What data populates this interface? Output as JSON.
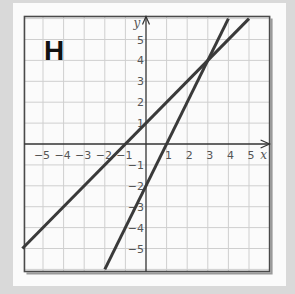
{
  "panel": {
    "letter": "H"
  },
  "chart_data": {
    "type": "line",
    "title": "H",
    "xlabel": "x",
    "ylabel": "y",
    "xlim": [
      -5.9,
      6
    ],
    "ylim": [
      -6.1,
      6.1
    ],
    "grid": true,
    "legend": null,
    "x_ticks": [
      -5,
      -4,
      -3,
      -2,
      -1,
      1,
      2,
      3,
      4,
      5
    ],
    "y_ticks": [
      -5,
      -4,
      -3,
      -2,
      -1,
      1,
      2,
      3,
      4,
      5
    ],
    "x_tick_labels": [
      "−5",
      "−4",
      "−3",
      "−2",
      "−1",
      "1",
      "2",
      "3",
      "4",
      "5"
    ],
    "y_tick_labels": [
      "−5",
      "−4",
      "−3",
      "−2",
      "−1",
      "1",
      "2",
      "3",
      "4",
      "5"
    ],
    "series": [
      {
        "name": "y = x + 1",
        "slope": 1,
        "intercept": 1,
        "x": [
          -6,
          5
        ],
        "y": [
          -5,
          6
        ]
      },
      {
        "name": "y = 2x − 2",
        "slope": 2,
        "intercept": -2,
        "x": [
          -2,
          4
        ],
        "y": [
          -6,
          6
        ]
      }
    ],
    "annotations": [
      {
        "type": "intersection",
        "x": 3,
        "y": 4
      }
    ]
  }
}
